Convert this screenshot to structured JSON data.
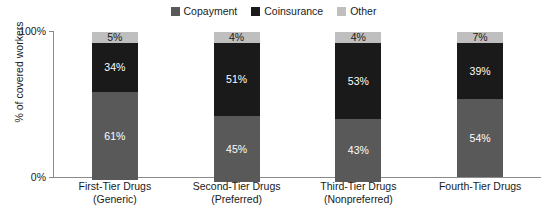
{
  "chart_data": {
    "type": "bar",
    "subtype": "stacked-100-percent",
    "title": "",
    "xlabel": "",
    "ylabel": "% of covered workers",
    "ylim": [
      0,
      100
    ],
    "ytick_labels": [
      "0%",
      "100%"
    ],
    "grid": false,
    "legend_position": "top-center",
    "categories": [
      "First-Tier Drugs",
      "Second-Tier Drugs",
      "Third-Tier Drugs",
      "Fourth-Tier Drugs"
    ],
    "category_sublabels": [
      "(Generic)",
      "(Preferred)",
      "(Nonpreferred)",
      ""
    ],
    "series": [
      {
        "name": "Copayment",
        "color": "#595959",
        "values": [
          61,
          45,
          43,
          54
        ]
      },
      {
        "name": "Coinsurance",
        "color": "#1a1a1a",
        "values": [
          34,
          51,
          53,
          39
        ]
      },
      {
        "name": "Other",
        "color": "#bfbfbf",
        "values": [
          5,
          4,
          4,
          7
        ]
      }
    ],
    "value_labels": [
      {
        "category": "First-Tier Drugs",
        "Other": "5%",
        "Coinsurance": "34%",
        "Copayment": "61%"
      },
      {
        "category": "Second-Tier Drugs",
        "Other": "4%",
        "Coinsurance": "51%",
        "Copayment": "45%"
      },
      {
        "category": "Third-Tier Drugs",
        "Other": "4%",
        "Coinsurance": "53%",
        "Copayment": "43%"
      },
      {
        "category": "Fourth-Tier Drugs",
        "Other": "7%",
        "Coinsurance": "39%",
        "Copayment": "54%"
      }
    ]
  },
  "legend": {
    "items": [
      {
        "label": "Copayment",
        "color": "#595959"
      },
      {
        "label": "Coinsurance",
        "color": "#1a1a1a"
      },
      {
        "label": "Other",
        "color": "#bfbfbf"
      }
    ]
  },
  "axes": {
    "y_label": "% of covered workers",
    "y_top": "100%",
    "y_bottom": "0%"
  },
  "bars": [
    {
      "category": "First-Tier Drugs",
      "sublabel": "(Generic)",
      "segments": [
        {
          "name": "Other",
          "label": "5%",
          "value": 5,
          "color": "#bfbfbf"
        },
        {
          "name": "Coinsurance",
          "label": "34%",
          "value": 34,
          "color": "#1a1a1a"
        },
        {
          "name": "Copayment",
          "label": "61%",
          "value": 61,
          "color": "#595959"
        }
      ]
    },
    {
      "category": "Second-Tier Drugs",
      "sublabel": "(Preferred)",
      "segments": [
        {
          "name": "Other",
          "label": "4%",
          "value": 4,
          "color": "#bfbfbf"
        },
        {
          "name": "Coinsurance",
          "label": "51%",
          "value": 51,
          "color": "#1a1a1a"
        },
        {
          "name": "Copayment",
          "label": "45%",
          "value": 45,
          "color": "#595959"
        }
      ]
    },
    {
      "category": "Third-Tier Drugs",
      "sublabel": "(Nonpreferred)",
      "segments": [
        {
          "name": "Other",
          "label": "4%",
          "value": 4,
          "color": "#bfbfbf"
        },
        {
          "name": "Coinsurance",
          "label": "53%",
          "value": 53,
          "color": "#1a1a1a"
        },
        {
          "name": "Copayment",
          "label": "43%",
          "value": 43,
          "color": "#595959"
        }
      ]
    },
    {
      "category": "Fourth-Tier Drugs",
      "sublabel": "",
      "segments": [
        {
          "name": "Other",
          "label": "7%",
          "value": 7,
          "color": "#bfbfbf"
        },
        {
          "name": "Coinsurance",
          "label": "39%",
          "value": 39,
          "color": "#1a1a1a"
        },
        {
          "name": "Copayment",
          "label": "54%",
          "value": 54,
          "color": "#595959"
        }
      ]
    }
  ]
}
